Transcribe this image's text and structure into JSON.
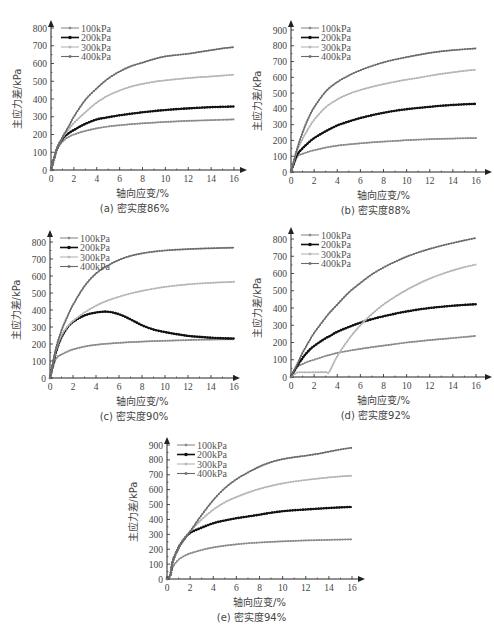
{
  "figure": {
    "legend": [
      "100kPa",
      "200kPa",
      "300kPa",
      "400kPa"
    ],
    "series_colors": {
      "100kPa": "#8a8a8a",
      "200kPa": "#111111",
      "300kPa": "#b5b5b5",
      "400kPa": "#6a6a6a"
    },
    "xlabel": "轴向应变/%",
    "ylabel": "主应力差/kPa"
  },
  "chart_data": [
    {
      "id": "a",
      "type": "line",
      "caption": "(a) 密实度86%",
      "xlabel": "轴向应变/%",
      "ylabel": "主应力差/kPa",
      "xlim": [
        0,
        16
      ],
      "ylim": [
        0,
        800
      ],
      "xticks": [
        0,
        2,
        4,
        6,
        8,
        10,
        12,
        14,
        16
      ],
      "yticks": [
        0,
        100,
        200,
        300,
        400,
        500,
        600,
        700,
        800
      ],
      "legend_position": "top-left",
      "x": [
        0,
        0.5,
        1,
        1.5,
        2,
        3,
        4,
        5,
        6,
        7,
        8,
        9,
        10,
        11,
        12,
        13,
        14,
        15,
        16
      ],
      "series": [
        {
          "name": "100kPa",
          "values": [
            0,
            110,
            160,
            185,
            200,
            220,
            235,
            245,
            252,
            258,
            263,
            267,
            271,
            274,
            277,
            279,
            281,
            283,
            285
          ]
        },
        {
          "name": "200kPa",
          "values": [
            0,
            115,
            175,
            205,
            225,
            260,
            285,
            297,
            308,
            317,
            325,
            332,
            338,
            343,
            347,
            351,
            354,
            356,
            358
          ]
        },
        {
          "name": "300kPa",
          "values": [
            0,
            115,
            180,
            225,
            265,
            325,
            380,
            420,
            448,
            470,
            485,
            497,
            505,
            512,
            518,
            523,
            527,
            532,
            537
          ]
        },
        {
          "name": "400kPa",
          "values": [
            0,
            115,
            185,
            240,
            300,
            395,
            460,
            515,
            555,
            585,
            605,
            625,
            640,
            648,
            655,
            665,
            675,
            685,
            692
          ]
        }
      ]
    },
    {
      "id": "b",
      "type": "line",
      "caption": "(b) 密实度88%",
      "xlabel": "轴向应变/%",
      "ylabel": "主应力差/kPa",
      "xlim": [
        0,
        16
      ],
      "ylim": [
        0,
        900
      ],
      "xticks": [
        0,
        2,
        4,
        6,
        8,
        10,
        12,
        14,
        16
      ],
      "yticks": [
        0,
        100,
        200,
        300,
        400,
        500,
        600,
        700,
        800,
        900
      ],
      "legend_position": "top-left",
      "x": [
        0,
        0.5,
        1,
        1.5,
        2,
        3,
        4,
        5,
        6,
        7,
        8,
        9,
        10,
        11,
        12,
        13,
        14,
        15,
        16
      ],
      "series": [
        {
          "name": "100kPa",
          "values": [
            0,
            95,
            115,
            128,
            138,
            155,
            167,
            175,
            182,
            188,
            193,
            197,
            202,
            205,
            208,
            210,
            212,
            214,
            215
          ]
        },
        {
          "name": "200kPa",
          "values": [
            0,
            105,
            150,
            185,
            215,
            258,
            295,
            320,
            342,
            360,
            375,
            388,
            398,
            406,
            413,
            420,
            425,
            429,
            432
          ]
        },
        {
          "name": "300kPa",
          "values": [
            0,
            130,
            210,
            275,
            330,
            410,
            460,
            495,
            520,
            540,
            557,
            572,
            585,
            597,
            610,
            622,
            632,
            641,
            648
          ]
        },
        {
          "name": "400kPa",
          "values": [
            0,
            140,
            250,
            340,
            410,
            510,
            570,
            612,
            645,
            672,
            695,
            713,
            728,
            742,
            755,
            765,
            772,
            778,
            783
          ]
        }
      ]
    },
    {
      "id": "c",
      "type": "line",
      "caption": "(c) 密实度90%",
      "xlabel": "轴向应变/%",
      "ylabel": "主应力差/kPa",
      "xlim": [
        0,
        16
      ],
      "ylim": [
        0,
        800
      ],
      "xticks": [
        0,
        2,
        4,
        6,
        8,
        10,
        12,
        14,
        16
      ],
      "yticks": [
        0,
        100,
        200,
        300,
        400,
        500,
        600,
        700,
        800
      ],
      "legend_position": "top-left",
      "x": [
        0,
        0.5,
        1,
        1.5,
        2,
        3,
        4,
        5,
        6,
        7,
        8,
        9,
        10,
        11,
        12,
        13,
        14,
        15,
        16
      ],
      "series": [
        {
          "name": "100kPa",
          "values": [
            0,
            110,
            138,
            155,
            168,
            185,
            195,
            202,
            207,
            211,
            214,
            217,
            219,
            221,
            223,
            225,
            226,
            227,
            228
          ]
        },
        {
          "name": "200kPa",
          "values": [
            0,
            150,
            240,
            295,
            330,
            368,
            385,
            390,
            375,
            345,
            310,
            285,
            270,
            258,
            248,
            242,
            237,
            234,
            232
          ]
        },
        {
          "name": "300kPa",
          "values": [
            0,
            160,
            250,
            300,
            335,
            385,
            425,
            455,
            478,
            497,
            512,
            525,
            536,
            544,
            551,
            556,
            560,
            563,
            566
          ]
        },
        {
          "name": "400kPa",
          "values": [
            0,
            170,
            280,
            360,
            430,
            540,
            615,
            660,
            695,
            718,
            733,
            743,
            750,
            755,
            758,
            761,
            763,
            765,
            767
          ]
        }
      ]
    },
    {
      "id": "d",
      "type": "line",
      "caption": "(d) 密实度92%",
      "xlabel": "轴向应变/%",
      "ylabel": "主应力差/kPa",
      "xlim": [
        0,
        16
      ],
      "ylim": [
        0,
        800
      ],
      "xticks": [
        0,
        2,
        4,
        6,
        8,
        10,
        12,
        14,
        16
      ],
      "yticks": [
        0,
        100,
        200,
        300,
        400,
        500,
        600,
        700,
        800
      ],
      "legend_position": "top-left",
      "x": [
        0,
        0.5,
        1,
        1.5,
        2,
        3,
        3.3,
        4,
        5,
        6,
        7,
        8,
        9,
        10,
        11,
        12,
        13,
        14,
        15,
        16
      ],
      "series": [
        {
          "name": "100kPa",
          "values": [
            0,
            55,
            75,
            90,
            100,
            122,
            127,
            140,
            152,
            163,
            173,
            182,
            191,
            200,
            207,
            214,
            220,
            226,
            232,
            238
          ]
        },
        {
          "name": "200kPa",
          "values": [
            0,
            60,
            110,
            150,
            180,
            225,
            235,
            262,
            290,
            315,
            335,
            352,
            367,
            380,
            391,
            400,
            407,
            413,
            418,
            422
          ]
        },
        {
          "name": "300kPa",
          "values": [
            0,
            25,
            27,
            27,
            27,
            28,
            30,
            120,
            220,
            300,
            365,
            420,
            465,
            505,
            540,
            570,
            596,
            618,
            637,
            652
          ]
        },
        {
          "name": "400kPa",
          "values": [
            0,
            70,
            140,
            200,
            255,
            345,
            370,
            420,
            490,
            545,
            595,
            635,
            668,
            698,
            722,
            743,
            761,
            777,
            792,
            806
          ]
        }
      ]
    },
    {
      "id": "e",
      "type": "line",
      "caption": "(e) 密实度94%",
      "xlabel": "轴向应变/%",
      "ylabel": "主应力差/kPa",
      "xlim": [
        0,
        16
      ],
      "ylim": [
        0,
        900
      ],
      "xticks": [
        0,
        2,
        4,
        6,
        8,
        10,
        12,
        14,
        16
      ],
      "yticks": [
        0,
        100,
        200,
        300,
        400,
        500,
        600,
        700,
        800,
        900
      ],
      "legend_position": "top-left",
      "x": [
        0,
        0.3,
        0.5,
        1,
        1.5,
        2,
        3,
        4,
        5,
        6,
        7,
        8,
        9,
        10,
        11,
        12,
        13,
        14,
        15,
        16
      ],
      "series": [
        {
          "name": "100kPa",
          "values": [
            0,
            30,
            80,
            130,
            155,
            172,
            195,
            212,
            224,
            233,
            240,
            245,
            249,
            253,
            256,
            259,
            261,
            263,
            265,
            266
          ]
        },
        {
          "name": "200kPa",
          "values": [
            0,
            30,
            120,
            210,
            270,
            310,
            345,
            375,
            393,
            408,
            420,
            432,
            445,
            455,
            462,
            467,
            472,
            477,
            481,
            484
          ]
        },
        {
          "name": "300kPa",
          "values": [
            0,
            30,
            120,
            210,
            270,
            320,
            400,
            465,
            515,
            550,
            580,
            605,
            625,
            642,
            655,
            665,
            674,
            682,
            689,
            694
          ]
        },
        {
          "name": "400kPa",
          "values": [
            0,
            30,
            120,
            210,
            270,
            320,
            430,
            530,
            610,
            670,
            715,
            755,
            785,
            805,
            818,
            828,
            840,
            855,
            870,
            882
          ]
        }
      ]
    }
  ]
}
